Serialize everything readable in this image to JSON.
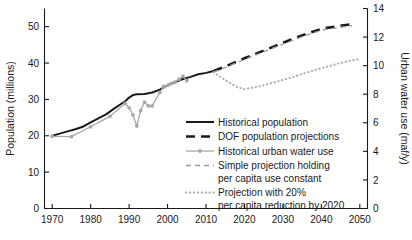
{
  "chart_data": {
    "type": "line",
    "title": "",
    "xlabel": "",
    "ylabel": "Population (millions)",
    "y2label": "Urban water use (maf/y)",
    "xlim": [
      1968,
      2052
    ],
    "ylim": [
      0,
      55
    ],
    "y2lim": [
      0,
      14
    ],
    "grid": false,
    "legend_position": "center-right-inside",
    "xticks": [
      1970,
      1980,
      1990,
      2000,
      2010,
      2020,
      2030,
      2040,
      2050
    ],
    "xtick_labels": [
      "1970",
      "1980",
      "1990",
      "2000",
      "2010",
      "2020",
      "2030",
      "2040",
      "2050"
    ],
    "yticks": [
      0,
      10,
      20,
      30,
      40,
      50
    ],
    "ytick_labels": [
      "0",
      "10",
      "20",
      "30",
      "40",
      "50"
    ],
    "y2ticks": [
      0,
      2,
      4,
      6,
      8,
      10,
      12,
      14
    ],
    "y2tick_labels": [
      "0",
      "2",
      "4",
      "6",
      "8",
      "10",
      "12",
      "14"
    ],
    "series": [
      {
        "name": "Historical population",
        "axis": "left",
        "style": "solid",
        "color": "#1a1a1a",
        "width": 2.0,
        "markers": false,
        "x": [
          1970,
          1972,
          1974,
          1976,
          1978,
          1980,
          1982,
          1984,
          1986,
          1988,
          1989,
          1990,
          1991,
          1992,
          1994,
          1996,
          1998,
          2000,
          2002,
          2004,
          2006,
          2008,
          2010,
          2012
        ],
        "y": [
          20.0,
          20.6,
          21.2,
          21.8,
          22.5,
          23.7,
          24.8,
          25.9,
          27.4,
          28.8,
          29.5,
          30.5,
          31.2,
          31.4,
          31.5,
          31.9,
          32.7,
          33.9,
          34.8,
          35.6,
          36.2,
          36.9,
          37.3,
          37.8
        ]
      },
      {
        "name": "DOF population projections",
        "axis": "left",
        "style": "dashed",
        "color": "#1a1a1a",
        "width": 2.6,
        "markers": false,
        "x": [
          2012,
          2016,
          2020,
          2024,
          2028,
          2032,
          2036,
          2040,
          2044,
          2048
        ],
        "y": [
          37.8,
          39.5,
          41.3,
          43.0,
          44.7,
          46.4,
          48.0,
          49.4,
          50.1,
          50.7
        ]
      },
      {
        "name": "Historical urban water use",
        "axis": "right",
        "style": "solid-markers",
        "color": "#a8a8a8",
        "width": 1.3,
        "markers": true,
        "x": [
          1970,
          1975,
          1980,
          1985,
          1989,
          1990,
          1991,
          1992,
          1993,
          1994,
          1995,
          1996,
          1998,
          1999,
          2000,
          2001,
          2002,
          2003,
          2004,
          2005
        ],
        "y": [
          5.05,
          5.03,
          5.72,
          6.45,
          7.35,
          7.05,
          6.55,
          5.77,
          6.85,
          7.45,
          7.18,
          7.18,
          8.12,
          8.55,
          8.62,
          8.75,
          8.85,
          9.05,
          9.25,
          8.95
        ]
      },
      {
        "name": "Simple projection holding per capita use constant",
        "axis": "right",
        "style": "gray-dashed",
        "color": "#9a9a9a",
        "width": 1.3,
        "markers": false,
        "x": [
          2012,
          2016,
          2020,
          2024,
          2028,
          2032,
          2036,
          2040,
          2044,
          2048
        ],
        "y": [
          9.55,
          9.98,
          10.43,
          10.86,
          11.29,
          11.72,
          12.12,
          12.48,
          12.65,
          12.8
        ]
      },
      {
        "name": "Projection with 20% per capita reduction by 2020",
        "axis": "right",
        "style": "dotted",
        "color": "#adadad",
        "width": 2.0,
        "markers": false,
        "x": [
          2012,
          2014,
          2016,
          2018,
          2020,
          2024,
          2028,
          2032,
          2036,
          2040,
          2044,
          2048,
          2050
        ],
        "y": [
          9.55,
          9.15,
          8.82,
          8.52,
          8.35,
          8.55,
          8.85,
          9.15,
          9.5,
          9.82,
          10.12,
          10.38,
          10.45
        ]
      }
    ],
    "legend": [
      {
        "label": "Historical population",
        "style": "solid",
        "color": "#1a1a1a"
      },
      {
        "label": "DOF population projections",
        "style": "dashed",
        "color": "#1a1a1a"
      },
      {
        "label": "Historical urban water use",
        "style": "solid-markers",
        "color": "#a8a8a8"
      },
      {
        "label": "Simple projection holding",
        "label2": "per capita use constant",
        "style": "gray-dashed",
        "color": "#9a9a9a"
      },
      {
        "label": "Projection with 20%",
        "label2": "per capita reduction by 2020",
        "style": "dotted",
        "color": "#adadad"
      }
    ]
  }
}
